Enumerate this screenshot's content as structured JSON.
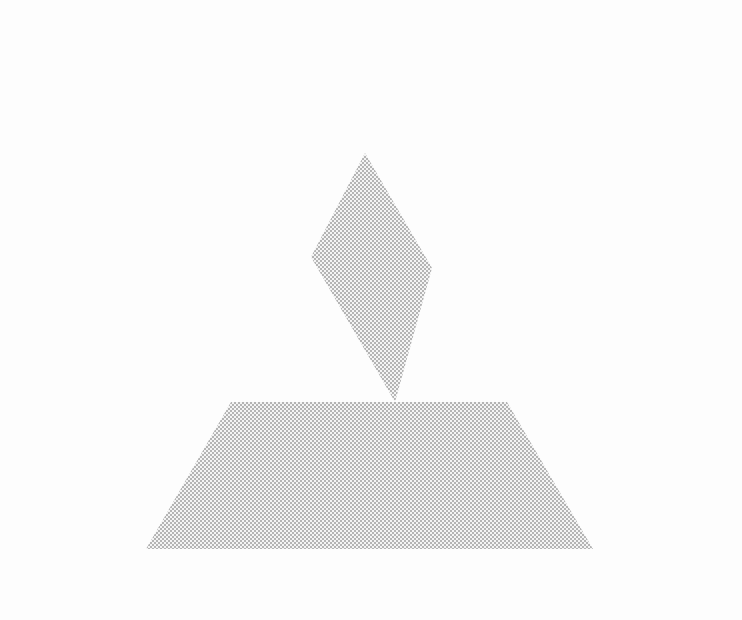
{
  "diagram": {
    "type": "triangular-coordinate-diagram",
    "vertices": {
      "L": {
        "label": "L"
      },
      "M": {
        "label": "M"
      },
      "N": {
        "label": "N"
      }
    },
    "points": {
      "P": {
        "label": "P"
      },
      "F": {
        "label": "F"
      },
      "D": {
        "label": "D"
      },
      "E": {
        "label": "E"
      }
    },
    "angles": {
      "left": "60°",
      "right": "60°"
    },
    "annotations": {
      "gC": "g(C) = −2",
      "gB": "g(B) = −1",
      "gA": "g(A) = 0",
      "G": "G = 1",
      "x2_val": "x₂ = 0.5",
      "x3_val": "x₃ = −1",
      "x1_val": "x₁ = 1.5"
    },
    "axis_labels": {
      "x1": {
        "gt": "x₁ > 0",
        "eq": "x₁ = 0",
        "lt": "x₁ < 0"
      },
      "x2": {
        "lt": "x₂ < 0",
        "eq": "x₂ = 0",
        "gt": "x₂ > 0"
      },
      "x3": {
        "gt": "x₃ > 0",
        "eq": "x₃ = 0",
        "lt": "x₃ < 0"
      }
    },
    "colors": {
      "line": "#111111",
      "shading": "#bdbdbd",
      "background": "#fdfdfd"
    }
  }
}
